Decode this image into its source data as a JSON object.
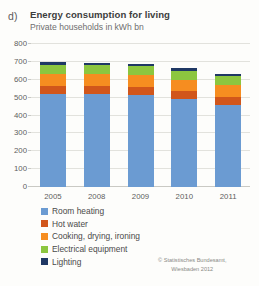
{
  "panel": {
    "letter": "d)",
    "title": "Energy consumption for living",
    "subtitle": "Private households in kWh bn"
  },
  "source": {
    "line1": "© Statistisches Bundesamt,",
    "line2": "Wiesbaden 2012"
  },
  "legend": {
    "items": [
      {
        "label": "Room heating",
        "color": "#6b9bd2"
      },
      {
        "label": "Hot water",
        "color": "#d1561b"
      },
      {
        "label": "Cooking, drying, ironing",
        "color": "#f68d20"
      },
      {
        "label": "Electrical equipment",
        "color": "#8cc63f"
      },
      {
        "label": "Lighting",
        "color": "#1f3864"
      }
    ]
  },
  "chart_data": {
    "type": "bar",
    "subtype": "stacked-column",
    "title": "Energy consumption for living",
    "subtitle": "Private households in kWh bn",
    "xlabel": "",
    "ylabel": "kWh bn",
    "ylim": [
      0,
      800
    ],
    "yticks": [
      0,
      100,
      200,
      300,
      400,
      500,
      600,
      700,
      800
    ],
    "grid": true,
    "legend_position": "bottom-left",
    "categories": [
      "2005",
      "2008",
      "2009",
      "2010",
      "2011"
    ],
    "series": [
      {
        "name": "Room heating",
        "color": "#6b9bd2",
        "values": [
          520,
          520,
          515,
          490,
          460
        ]
      },
      {
        "name": "Hot water",
        "color": "#d1561b",
        "values": [
          45,
          45,
          45,
          45,
          45
        ]
      },
      {
        "name": "Cooking, drying, ironing",
        "color": "#f68d20",
        "values": [
          65,
          65,
          65,
          65,
          65
        ]
      },
      {
        "name": "Electrical equipment",
        "color": "#8cc63f",
        "values": [
          55,
          50,
          50,
          50,
          50
        ]
      },
      {
        "name": "Lighting",
        "color": "#1f3864",
        "values": [
          15,
          15,
          15,
          15,
          15
        ]
      }
    ],
    "totals": [
      700,
      695,
      690,
      665,
      635
    ]
  }
}
